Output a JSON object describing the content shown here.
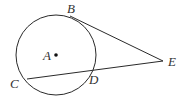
{
  "diagram": {
    "type": "geometry",
    "circle": {
      "center_label": "A",
      "cx": 56,
      "cy": 55,
      "r": 40
    },
    "points": {
      "A": {
        "label": "A",
        "x": 56,
        "y": 55,
        "label_x": 43,
        "label_y": 60
      },
      "B": {
        "label": "B",
        "x": 70,
        "y": 16,
        "label_x": 67,
        "label_y": 13
      },
      "C": {
        "label": "C",
        "x": 27,
        "y": 79,
        "label_x": 10,
        "label_y": 88
      },
      "D": {
        "label": "D",
        "x": 92,
        "y": 71,
        "label_x": 89,
        "label_y": 84
      },
      "E": {
        "label": "E",
        "x": 163,
        "y": 61,
        "label_x": 168,
        "label_y": 66
      }
    },
    "segments": [
      {
        "name": "tangent-BE",
        "from": "B",
        "to": "E"
      },
      {
        "name": "secant-CE",
        "from": "C",
        "to": "E"
      }
    ]
  }
}
